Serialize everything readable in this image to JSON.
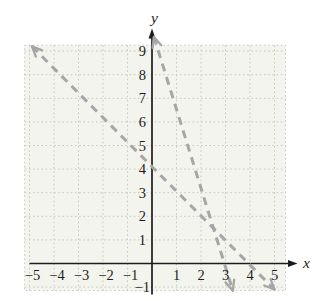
{
  "figure": {
    "xlabel": "x",
    "ylabel": "y"
  },
  "chart_data": {
    "type": "line",
    "title": "",
    "xlabel": "x",
    "ylabel": "y",
    "xlim": [
      -5.2,
      5.45
    ],
    "ylim": [
      -1.15,
      9.25
    ],
    "x_ticks": [
      -5,
      -4,
      -3,
      -2,
      -1,
      1,
      2,
      3,
      4,
      5
    ],
    "y_ticks": [
      -1,
      1,
      2,
      3,
      4,
      5,
      6,
      7,
      8,
      9
    ],
    "grid": "dotted",
    "legend": "none",
    "series": [
      {
        "name": "line-1",
        "description": "dashed gray line with arrowheads on both ends",
        "approx_equation": "y = -x + 4",
        "slope": -1,
        "y_intercept": 4,
        "x_intercept": 4,
        "endpoints": [
          [
            -4.9,
            9.2
          ],
          [
            5.0,
            -1.1
          ]
        ],
        "style": "dashed",
        "color": "#a6a6a6",
        "arrows": "both"
      },
      {
        "name": "line-2",
        "description": "dashed gray line with arrowheads on both ends",
        "approx_equation": "y = -3x + 9",
        "slope": -3,
        "y_intercept": 9,
        "x_intercept": 3,
        "endpoints": [
          [
            0.08,
            9.6
          ],
          [
            3.3,
            -1.15
          ]
        ],
        "style": "dashed",
        "color": "#a6a6a6",
        "arrows": "both"
      }
    ],
    "colors": {
      "axis": "#1c1c1c",
      "grid": "#c8c8c0",
      "plot_background": "#f4f4ef",
      "page_background": "#ffffff",
      "tick_labels": "#1c1c1c"
    }
  }
}
